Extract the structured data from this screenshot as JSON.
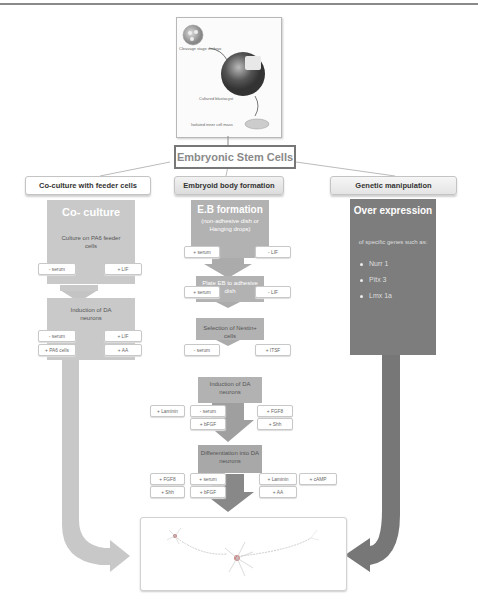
{
  "embryo_illustration": {
    "labels": [
      "Cleavage stage embryo",
      "Cultured blastocyst",
      "Isolated inner cell mass"
    ]
  },
  "root": {
    "title": "Embryonic Stem Cells"
  },
  "branches": [
    {
      "header": "Co-culture with feeder cells",
      "title": "Co- culture",
      "steps": [
        {
          "text": "Culture on PA6 feeder cells",
          "left_chips": [
            "- serum"
          ],
          "right_chips": [
            "+ LIF"
          ]
        },
        {
          "text": "Induction of DA neurons",
          "left_chips": [
            "- serum",
            "+ PA6 cells"
          ],
          "right_chips": [
            "+ LIF",
            "+ AA"
          ]
        }
      ]
    },
    {
      "header": "Embryoid body formation",
      "title": "E.B formation",
      "subtitle": "(non-adhesive dish or Hanging drops)",
      "steps": [
        {
          "text": "",
          "left_chips": [
            "+ serum"
          ],
          "right_chips": [
            "- LIF"
          ]
        },
        {
          "text": "Plate EB to adhesive dish",
          "left_chips": [
            "+ serum"
          ],
          "right_chips": [
            "- LIF"
          ]
        },
        {
          "text": "Selection of Nestin+ cells",
          "left_chips": [
            "- serum"
          ],
          "right_chips": [
            "+ ITSF"
          ]
        },
        {
          "text": "Induction of DA neurons",
          "outer_left_chips": [
            "+ Laminin"
          ],
          "left_chips": [
            "- serum",
            "+ bFGF"
          ],
          "right_chips": [
            "+ FGF8",
            "+ Shh"
          ]
        },
        {
          "text": "Differentiation into DA neurons",
          "outer_left_chips": [
            "+ FGF8",
            "+ Shh"
          ],
          "left_chips": [
            "+ serum",
            "+ bFGF"
          ],
          "right_chips": [
            "+ Laminin",
            "+ AA"
          ],
          "outer_right_chips": [
            "+ cAMP"
          ]
        }
      ]
    },
    {
      "header": "Genetic manipulation",
      "title": "Over expression",
      "description": "of specific genes such as:",
      "genes": [
        "Nurr 1",
        "Pitx 3",
        "Lmx 1a"
      ]
    }
  ],
  "outcome": {
    "illustration": "dopaminergic-neuron"
  },
  "colors": {
    "light_gray": "#c9c9c9",
    "mid_gray": "#b2b2b2",
    "dark_gray": "#7d7d7d"
  }
}
